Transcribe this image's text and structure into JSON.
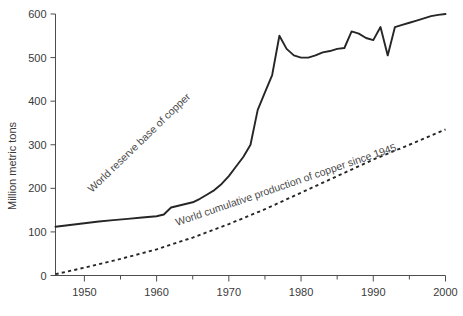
{
  "chart_data": {
    "type": "line",
    "title": "",
    "subtitle": "",
    "xlabel": "",
    "ylabel": "Million metric tons",
    "xlim": [
      1946,
      2000
    ],
    "ylim": [
      0,
      600
    ],
    "grid": false,
    "legend": "none",
    "x_ticks": [
      1950,
      1960,
      1970,
      1980,
      1990,
      2000
    ],
    "x_tick_labels": [
      "1950",
      "1960",
      "1970",
      "1980",
      "1990",
      "2000"
    ],
    "x_minor_ticks": [
      1955,
      1965,
      1975,
      1985,
      1995
    ],
    "y_ticks": [
      0,
      100,
      200,
      300,
      400,
      500,
      600
    ],
    "y_tick_labels": [
      "0",
      "100",
      "200",
      "300",
      "400",
      "500",
      "600"
    ],
    "series": [
      {
        "name": "World reserve base of copper",
        "style": "solid",
        "annotation": "World reserve base of copper",
        "x": [
          1946,
          1948,
          1950,
          1952,
          1954,
          1956,
          1958,
          1960,
          1961,
          1962,
          1963,
          1964,
          1965,
          1966,
          1967,
          1968,
          1969,
          1970,
          1971,
          1972,
          1973,
          1974,
          1975,
          1976,
          1977,
          1978,
          1979,
          1980,
          1981,
          1982,
          1983,
          1984,
          1985,
          1986,
          1987,
          1988,
          1989,
          1990,
          1991,
          1992,
          1993,
          1994,
          1995,
          1996,
          1997,
          1998,
          1999,
          2000
        ],
        "y": [
          112,
          116,
          120,
          124,
          127,
          130,
          133,
          136,
          140,
          156,
          160,
          164,
          168,
          176,
          186,
          196,
          210,
          228,
          250,
          272,
          300,
          380,
          420,
          460,
          550,
          520,
          505,
          500,
          500,
          505,
          512,
          515,
          520,
          522,
          560,
          555,
          545,
          540,
          570,
          505,
          570,
          575,
          580,
          585,
          590,
          595,
          598,
          600
        ]
      },
      {
        "name": "World cumulative production of copper since 1945",
        "style": "dotted",
        "annotation": "World cumulative production of copper since 1945",
        "x": [
          1946,
          1950,
          1955,
          1960,
          1965,
          1970,
          1975,
          1980,
          1985,
          1990,
          1995,
          2000
        ],
        "y": [
          3,
          18,
          38,
          60,
          87,
          118,
          152,
          190,
          228,
          266,
          300,
          335
        ]
      }
    ]
  },
  "axes": {
    "y_axis_title": "Million metric tons"
  }
}
